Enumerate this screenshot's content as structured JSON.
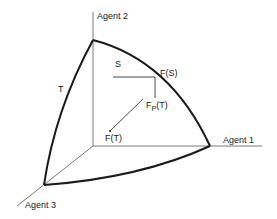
{
  "diagram": {
    "type": "utility-simplex-3-agents",
    "axes": {
      "agent1": {
        "label": "Agent 1"
      },
      "agent2": {
        "label": "Agent 2"
      },
      "agent3": {
        "label": "Agent 3"
      }
    },
    "regions": {
      "outer": {
        "label": "T"
      },
      "inner": {
        "label": "S"
      }
    },
    "points": {
      "fs": {
        "label": "F(S)"
      },
      "fpt": {
        "label_main": "F",
        "label_sub": "P",
        "label_tail": "(T)"
      },
      "ft": {
        "label": "F(T)"
      }
    },
    "colors": {
      "line": "#1a1a1a",
      "axis": "#555555",
      "text": "#222222",
      "background": "#ffffff"
    }
  }
}
